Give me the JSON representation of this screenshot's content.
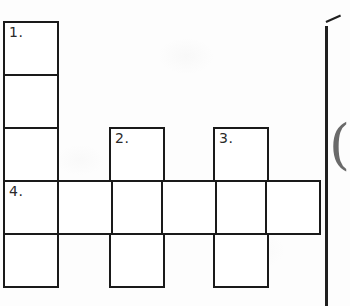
{
  "document": {
    "kind": "crossword-puzzle-grid",
    "background_color": "#fdfdfd",
    "ink_color": "#1a1a1a",
    "cell_fill_color": "#ffffff"
  },
  "grid": {
    "columns": 6,
    "rows": 5,
    "cell_width": 54,
    "cell_height": 53,
    "origin_x": 3,
    "origin_y": 21,
    "column_x": [
      3,
      57,
      109,
      161,
      213,
      265
    ],
    "row_y": [
      21,
      74,
      127,
      180,
      233
    ],
    "cells": [
      {
        "id": "c0r0",
        "col": 0,
        "row": 0,
        "number": "1."
      },
      {
        "id": "c0r1",
        "col": 0,
        "row": 1,
        "number": ""
      },
      {
        "id": "c0r2",
        "col": 0,
        "row": 2,
        "number": ""
      },
      {
        "id": "c0r3",
        "col": 0,
        "row": 3,
        "number": "4."
      },
      {
        "id": "c0r4",
        "col": 0,
        "row": 4,
        "number": ""
      },
      {
        "id": "c2r2",
        "col": 2,
        "row": 2,
        "number": "2."
      },
      {
        "id": "c2r3",
        "col": 2,
        "row": 3,
        "number": ""
      },
      {
        "id": "c2r4",
        "col": 2,
        "row": 4,
        "number": ""
      },
      {
        "id": "c4r2",
        "col": 4,
        "row": 2,
        "number": "3."
      },
      {
        "id": "c4r3",
        "col": 4,
        "row": 3,
        "number": ""
      },
      {
        "id": "c4r4",
        "col": 4,
        "row": 4,
        "number": ""
      },
      {
        "id": "c1r3",
        "col": 1,
        "row": 3,
        "number": ""
      },
      {
        "id": "c3r3",
        "col": 3,
        "row": 3,
        "number": ""
      },
      {
        "id": "c5r3",
        "col": 5,
        "row": 3,
        "number": ""
      }
    ],
    "clue_numbers": [
      "1.",
      "2.",
      "3.",
      "4."
    ],
    "entries": [
      {
        "number": "1.",
        "direction": "down",
        "start_col": 0,
        "start_row": 0,
        "length": 5
      },
      {
        "number": "2.",
        "direction": "down",
        "start_col": 2,
        "start_row": 2,
        "length": 3
      },
      {
        "number": "3.",
        "direction": "down",
        "start_col": 4,
        "start_row": 2,
        "length": 3
      },
      {
        "number": "4.",
        "direction": "across",
        "start_col": 0,
        "start_row": 3,
        "length": 6
      }
    ]
  },
  "margin": {
    "rule_label": "page-edge-rule",
    "tick_label": "page-corner-tick",
    "paren_glyph": "("
  }
}
